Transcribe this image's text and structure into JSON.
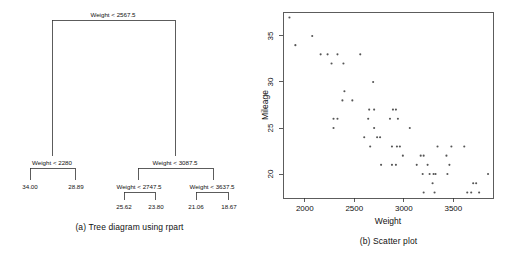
{
  "figure": {
    "tree_caption": "(a) Tree diagram using rpart",
    "scatter_caption": "(b) Scatter plot"
  },
  "tree": {
    "root": {
      "label": "Weight < 2567.5"
    },
    "nodes": [
      {
        "id": "n1",
        "label": "Weight < 2280"
      },
      {
        "id": "n2",
        "label": "Weight < 3087.5"
      },
      {
        "id": "n3",
        "label": "Weight < 2747.5"
      },
      {
        "id": "n4",
        "label": "Weight < 3637.5"
      }
    ],
    "leaves": [
      {
        "id": "l1",
        "value": "34.00"
      },
      {
        "id": "l2",
        "value": "28.89"
      },
      {
        "id": "l3",
        "value": "25.62"
      },
      {
        "id": "l4",
        "value": "23.80"
      },
      {
        "id": "l5",
        "value": "21.06"
      },
      {
        "id": "l6",
        "value": "18.67"
      }
    ]
  },
  "chart_data": {
    "type": "scatter",
    "title": "",
    "xlabel": "Weight",
    "ylabel": "Mileage",
    "xlim": [
      1780,
      3900
    ],
    "ylim": [
      17.4,
      37.6
    ],
    "xticks": [
      2000,
      2500,
      3000,
      3500
    ],
    "yticks": [
      20,
      25,
      30,
      35
    ],
    "grid": false,
    "legend": "none",
    "marker": "point",
    "marker_color": "#555555",
    "points": [
      [
        1845,
        37
      ],
      [
        1905,
        34
      ],
      [
        2075,
        35
      ],
      [
        2160,
        33
      ],
      [
        2230,
        33
      ],
      [
        2270,
        32
      ],
      [
        2330,
        33
      ],
      [
        2390,
        32
      ],
      [
        2560,
        33
      ],
      [
        2290,
        26
      ],
      [
        2330,
        26
      ],
      [
        2290,
        25
      ],
      [
        2400,
        29
      ],
      [
        2380,
        28
      ],
      [
        2480,
        28
      ],
      [
        2690,
        30
      ],
      [
        2650,
        27
      ],
      [
        2700,
        27
      ],
      [
        2640,
        26
      ],
      [
        2660,
        23
      ],
      [
        2700,
        25
      ],
      [
        2730,
        24
      ],
      [
        2760,
        24
      ],
      [
        2770,
        21
      ],
      [
        2600,
        24
      ],
      [
        2860,
        26
      ],
      [
        2890,
        27
      ],
      [
        2920,
        27
      ],
      [
        2940,
        26
      ],
      [
        2880,
        23
      ],
      [
        2930,
        23
      ],
      [
        2960,
        23
      ],
      [
        2880,
        21
      ],
      [
        2920,
        21
      ],
      [
        3060,
        25
      ],
      [
        2990,
        22
      ],
      [
        3130,
        21
      ],
      [
        3170,
        22
      ],
      [
        3200,
        22
      ],
      [
        3190,
        20
      ],
      [
        3200,
        18
      ],
      [
        3240,
        21
      ],
      [
        3260,
        20
      ],
      [
        3290,
        19
      ],
      [
        3300,
        20
      ],
      [
        3310,
        18
      ],
      [
        3340,
        23
      ],
      [
        3320,
        20
      ],
      [
        3430,
        22
      ],
      [
        3440,
        20
      ],
      [
        3460,
        21
      ],
      [
        3480,
        23
      ],
      [
        3610,
        23
      ],
      [
        3640,
        18
      ],
      [
        3680,
        18
      ],
      [
        3700,
        19
      ],
      [
        3730,
        19
      ],
      [
        3760,
        18
      ],
      [
        3850,
        20
      ]
    ]
  }
}
